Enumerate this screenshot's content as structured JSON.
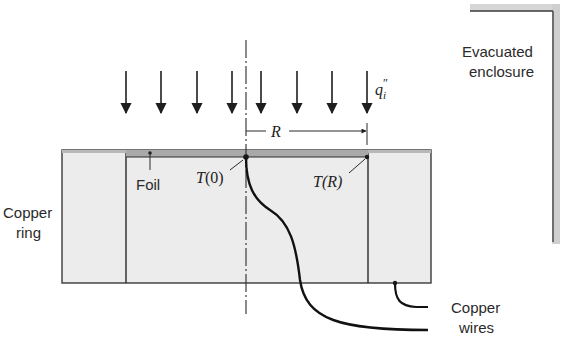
{
  "diagram": {
    "labels": {
      "enclosure": [
        "Evacuated",
        "enclosure"
      ],
      "copper_ring": [
        "Copper",
        "ring"
      ],
      "foil": "Foil",
      "t0": "T(0)",
      "t0_var": "T",
      "t0_arg": "(0)",
      "tr": "T(R)",
      "tr_var": "T",
      "tr_arg": "(R)",
      "radius": "R",
      "heat_flux": "q",
      "heat_flux_sub": "i",
      "heat_flux_sup": "″",
      "copper_wires": [
        "Copper",
        "wires"
      ]
    },
    "colors": {
      "ring_fill": "#ececec",
      "foil_fill": "#a9a9a9",
      "stroke": "#2a2a2a",
      "enclosure_edge": "#8a8a8a"
    },
    "arrow_count": 8
  }
}
